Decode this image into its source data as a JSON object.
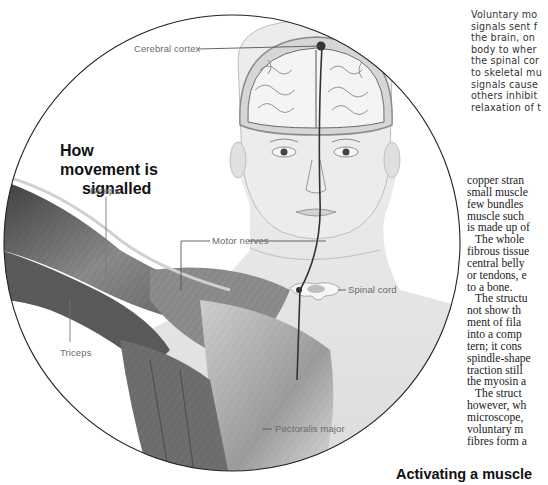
{
  "figure": {
    "title_lines": [
      "How",
      "movement is",
      "signalled"
    ],
    "labels": {
      "cerebral_cortex": "Cerebral cortex",
      "biceps": "Biceps",
      "motor_nerves": "Motor nerves",
      "spinal_cord": "Spinal cord",
      "triceps": "Triceps",
      "pectoralis_major": "Pectoralis major"
    },
    "colors": {
      "circle_outline": "#222222",
      "nerve_line": "#333333",
      "skin": "#e4e4e4",
      "muscle_dark": "#4a4a4a",
      "muscle_light": "#b5b5b5",
      "label_text": "#6a6a6a"
    }
  },
  "body_text": {
    "sans_paragraph_lines": [
      "Voluntary mo",
      "signals sent f",
      "the brain, on",
      "body to wher",
      "the spinal cor",
      "to skeletal mu",
      "signals cause",
      "others inhibit",
      "relaxation of t"
    ],
    "serif_paragraph_lines": [
      {
        "text": "copper stran",
        "indent": false
      },
      {
        "text": "small muscle",
        "indent": false
      },
      {
        "text": "few bundles",
        "indent": false
      },
      {
        "text": "muscle such",
        "indent": false
      },
      {
        "text": "is made up of",
        "indent": false
      },
      {
        "text": "The whole",
        "indent": true
      },
      {
        "text": "fibrous tissue",
        "indent": false
      },
      {
        "text": "central belly",
        "indent": false
      },
      {
        "text": "or tendons, e",
        "indent": false
      },
      {
        "text": "to a bone.",
        "indent": false
      },
      {
        "text": "The structu",
        "indent": true
      },
      {
        "text": "not show th",
        "indent": false
      },
      {
        "text": "ment of fila",
        "indent": false
      },
      {
        "text": "into a comp",
        "indent": false
      },
      {
        "text": "tern; it cons",
        "indent": false
      },
      {
        "text": "spindle-shape",
        "indent": false
      },
      {
        "text": "traction still",
        "indent": false
      },
      {
        "text": "the myosin a",
        "indent": false
      },
      {
        "text": "The struct",
        "indent": true
      },
      {
        "text": "however, wh",
        "indent": false
      },
      {
        "text": "microscope,",
        "indent": false
      },
      {
        "text": "voluntary m",
        "indent": false
      },
      {
        "text": "fibres form a",
        "indent": false
      }
    ]
  },
  "section_heading": "Activating a muscle"
}
